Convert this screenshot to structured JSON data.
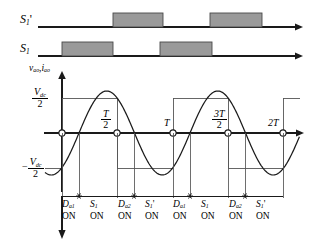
{
  "figure": {
    "kind": "half-bridge-inverter-switching-waveforms",
    "colors": {
      "line": "#1a1a1a",
      "pulse_fill": "#9a9a9a",
      "pulse_stroke": "#4a4a4a",
      "thin": "#555555",
      "background": "#ffffff"
    }
  },
  "gate_signals": [
    {
      "id": "s1prime",
      "label_base": "S",
      "label_sub": "1",
      "label_prime": "'",
      "name": "S1-prime",
      "baseline_y": 27,
      "pulse_height": 14,
      "pulses": [
        {
          "x": 113,
          "w": 50
        },
        {
          "x": 210,
          "w": 52
        }
      ]
    },
    {
      "id": "s1",
      "label_base": "S",
      "label_sub": "1",
      "label_prime": "",
      "name": "S1",
      "baseline_y": 56,
      "pulse_height": 14,
      "pulses": [
        {
          "x": 62,
          "w": 51
        },
        {
          "x": 160,
          "w": 52
        }
      ]
    }
  ],
  "axis": {
    "vertical_label": {
      "v": "v",
      "v_sub": "ao",
      "comma": ",",
      "i": "i",
      "i_sub": "ao"
    },
    "levels": [
      {
        "id": "positive",
        "sign": "",
        "numerator_base": "V",
        "numerator_sub": "dc",
        "denominator": "2",
        "y": 98
      },
      {
        "id": "negative",
        "sign": "−",
        "numerator_base": "V",
        "numerator_sub": "dc",
        "denominator": "2",
        "y": 168
      }
    ],
    "time_ticks": [
      {
        "label_num": "T",
        "label_den": "2",
        "fraction": true,
        "x": 117,
        "text": "T/2"
      },
      {
        "label_num": "T",
        "label_den": "",
        "fraction": false,
        "x": 173,
        "text": "T"
      },
      {
        "label_num": "3T",
        "label_den": "2",
        "fraction": true,
        "x": 228,
        "text": "3T/2"
      },
      {
        "label_num": "2T",
        "label_den": "",
        "fraction": false,
        "x": 283,
        "text": "2T"
      }
    ],
    "zero_crossing_markers_x": [
      62,
      117,
      173,
      228,
      283
    ],
    "zero_line_y": 133
  },
  "waveforms": {
    "voltage_square": {
      "name": "v-ao-square-wave",
      "high_y": 98,
      "low_y": 168,
      "period_px": 111,
      "transitions_x": [
        45,
        62,
        117,
        173,
        228,
        283
      ],
      "start_level": "low"
    },
    "current_sine": {
      "name": "i-ao-sine-wave",
      "amplitude_px": 42,
      "period_px": 111,
      "phase_lag_px": 17,
      "zero_line_y": 133,
      "x_start": 45,
      "x_end": 300
    }
  },
  "conduction_table": {
    "name": "device-conduction-sequence",
    "on_text": "ON",
    "boundaries_x": [
      62,
      79,
      117,
      134,
      173,
      190,
      228,
      245,
      283
    ],
    "segments": [
      {
        "device": "D",
        "sub": "a1",
        "prime": "",
        "state": "ON",
        "center_x": 70
      },
      {
        "device": "S",
        "sub": "1",
        "prime": "",
        "state": "ON",
        "center_x": 98
      },
      {
        "device": "D",
        "sub": "a2",
        "prime": "",
        "state": "ON",
        "center_x": 126
      },
      {
        "device": "S",
        "sub": "1",
        "prime": "'",
        "state": "ON",
        "center_x": 153
      },
      {
        "device": "D",
        "sub": "a1",
        "prime": "",
        "state": "ON",
        "center_x": 181
      },
      {
        "device": "S",
        "sub": "1",
        "prime": "",
        "state": "ON",
        "center_x": 209
      },
      {
        "device": "D",
        "sub": "a2",
        "prime": "",
        "state": "ON",
        "center_x": 237
      },
      {
        "device": "S",
        "sub": "1",
        "prime": "'",
        "state": "ON",
        "center_x": 264
      }
    ],
    "divider_y": 196,
    "marker_xs": [
      79,
      134,
      190,
      245
    ]
  }
}
